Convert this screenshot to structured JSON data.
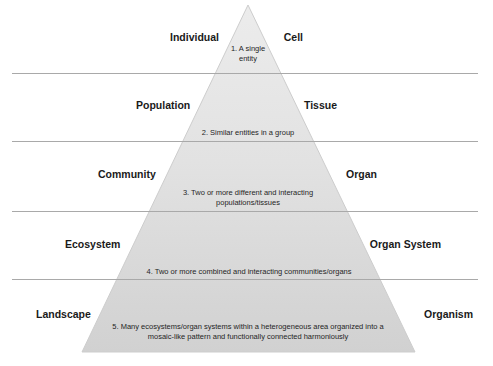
{
  "figure": {
    "type": "hierarchy-pyramid",
    "shape": "triangle",
    "fill_top_color": "#e8e8e8",
    "fill_bottom_color": "#d2d2d2",
    "stroke_color": "#c7c7c7",
    "divider_color": "#a9a9a9",
    "text_color": "#1a1a1a"
  },
  "levels": [
    {
      "number": "1",
      "left_label": "Individual",
      "right_label": "Cell",
      "description": "1. A single\nentity"
    },
    {
      "number": "2",
      "left_label": "Population",
      "right_label": "Tissue",
      "description": "2. Similar entities in a group"
    },
    {
      "number": "3",
      "left_label": "Community",
      "right_label": "Organ",
      "description": "3. Two or more different and interacting\npopulations/tissues"
    },
    {
      "number": "4",
      "left_label": "Ecosystem",
      "right_label": "Organ System",
      "description": "4. Two or more combined and interacting communities/organs"
    },
    {
      "number": "5",
      "left_label": "Landscape",
      "right_label": "Organism",
      "description": "5. Many ecosystems/organ systems within a heterogeneous area organized into a\nmosaic-like pattern and functionally connected harmoniously"
    }
  ]
}
